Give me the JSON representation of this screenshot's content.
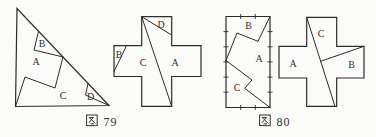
{
  "colors": {
    "ink": "#2e2c29",
    "label": "#33312e",
    "background": "#fbfbf9"
  },
  "captions": [
    {
      "text": "图 79",
      "glyph": "图",
      "number": "79"
    },
    {
      "text": "图 80",
      "glyph": "图",
      "number": "80"
    }
  ],
  "figures": [
    {
      "id": "fig79-triangle",
      "description": "right triangle dissected into pieces A, B, C, D",
      "outline": [
        [
          17,
          8.5
        ],
        [
          15.5,
          106.5
        ],
        [
          109,
          105.5
        ]
      ],
      "cuts": [
        [
          [
            38.5,
            31.5
          ],
          [
            34,
            50
          ],
          [
            63,
            57
          ]
        ],
        [
          [
            63,
            57
          ],
          [
            55,
            88
          ],
          [
            25,
            77
          ],
          [
            15.5,
            106.5
          ]
        ],
        [
          [
            88,
            83.5
          ],
          [
            85.5,
            95
          ],
          [
            109,
            105.5
          ]
        ]
      ],
      "ticks": [],
      "labels": [
        {
          "text": "A",
          "x": 36,
          "y": 65
        },
        {
          "text": "B",
          "x": 42,
          "y": 47
        },
        {
          "text": "C",
          "x": 63,
          "y": 98.5
        },
        {
          "text": "D",
          "x": 90.5,
          "y": 100
        }
      ]
    },
    {
      "id": "fig79-cross",
      "description": "greek cross dissected into pieces A, B, C, D",
      "outline": [
        [
          141.7,
          16.7
        ],
        [
          171.7,
          16.7
        ],
        [
          171.7,
          45.7
        ],
        [
          201,
          45.7
        ],
        [
          201,
          76.5
        ],
        [
          171.7,
          76.5
        ],
        [
          171.7,
          106.3
        ],
        [
          141.7,
          106.3
        ],
        [
          141.7,
          76.5
        ],
        [
          114,
          76.5
        ],
        [
          114,
          45.7
        ],
        [
          141.7,
          45.7
        ]
      ],
      "cuts": [
        [
          [
            141.7,
            16.7
          ],
          [
            171.7,
            106.3
          ]
        ],
        [
          [
            141.7,
            16.7
          ],
          [
            171.7,
            35
          ]
        ],
        [
          [
            126.5,
            45.7
          ],
          [
            114,
            71.5
          ]
        ]
      ],
      "ticks": [],
      "labels": [
        {
          "text": "A",
          "x": 175,
          "y": 65.5
        },
        {
          "text": "B",
          "x": 119,
          "y": 57.5
        },
        {
          "text": "C",
          "x": 143,
          "y": 65.5
        },
        {
          "text": "D",
          "x": 161,
          "y": 27.5
        }
      ]
    },
    {
      "id": "fig80-rect",
      "description": "1:2 rectangle with unit tick marks dissected into pieces A, B, C",
      "outline": [
        [
          226,
          16.5
        ],
        [
          270,
          16.5
        ],
        [
          270,
          107.5
        ],
        [
          226,
          107.5
        ]
      ],
      "cuts": [
        [
          [
            270,
            16.5
          ],
          [
            258,
            41.3
          ],
          [
            237,
            33
          ],
          [
            226,
            60.5
          ]
        ],
        [
          [
            226,
            60.5
          ],
          [
            252,
            80
          ],
          [
            244.7,
            88.3
          ],
          [
            270,
            107.5
          ]
        ]
      ],
      "ticks": [
        [
          223.5,
          31.6,
          228.5,
          31.6
        ],
        [
          223.5,
          46.8,
          228.5,
          46.8
        ],
        [
          223.5,
          61.9,
          228.5,
          61.9
        ],
        [
          223.5,
          77.1,
          228.5,
          77.1
        ],
        [
          223.5,
          92.2,
          228.5,
          92.2
        ],
        [
          267.5,
          31.6,
          272.5,
          31.6
        ],
        [
          267.5,
          46.8,
          272.5,
          46.8
        ],
        [
          267.5,
          61.9,
          272.5,
          61.9
        ],
        [
          267.5,
          77.1,
          272.5,
          77.1
        ],
        [
          267.5,
          92.2,
          272.5,
          92.2
        ],
        [
          240.7,
          14,
          240.7,
          19
        ],
        [
          255.3,
          14,
          255.3,
          19
        ],
        [
          240.7,
          105,
          240.7,
          110
        ],
        [
          255.3,
          105,
          255.3,
          110
        ]
      ],
      "labels": [
        {
          "text": "B",
          "x": 248.5,
          "y": 29
        },
        {
          "text": "A",
          "x": 259,
          "y": 62
        },
        {
          "text": "C",
          "x": 237,
          "y": 90.5
        }
      ]
    },
    {
      "id": "fig80-cross",
      "description": "greek cross dissected into pieces A, B, C",
      "outline": [
        [
          306.7,
          17.3
        ],
        [
          336.7,
          17.3
        ],
        [
          336.7,
          46.3
        ],
        [
          364,
          46.3
        ],
        [
          364,
          78
        ],
        [
          336.7,
          78
        ],
        [
          336.7,
          106.3
        ],
        [
          306.7,
          106.3
        ],
        [
          306.7,
          78
        ],
        [
          279,
          78
        ],
        [
          279,
          46.3
        ],
        [
          306.7,
          46.3
        ]
      ],
      "cuts": [
        [
          [
            306.7,
            17.3
          ],
          [
            335,
            106.3
          ]
        ],
        [
          [
            320.7,
            61.3
          ],
          [
            364,
            46.3
          ]
        ]
      ],
      "ticks": [],
      "labels": [
        {
          "text": "A",
          "x": 293,
          "y": 66.5
        },
        {
          "text": "B",
          "x": 351.5,
          "y": 68
        },
        {
          "text": "C",
          "x": 321,
          "y": 36.5
        }
      ]
    }
  ]
}
